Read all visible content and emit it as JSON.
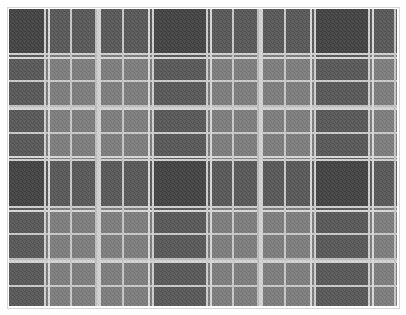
{
  "image": {
    "subject": "grayscale tartan plaid fabric pattern",
    "colors": {
      "background": "#ffffff",
      "border": "#d6d6d6",
      "base": "#7b7b7b",
      "dark_block": "#4a4a4a",
      "light_stripe": "#d9d9d9"
    }
  }
}
